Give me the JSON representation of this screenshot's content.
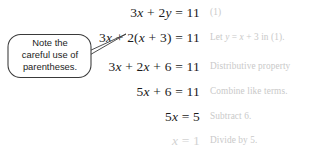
{
  "page": {
    "background_color": "#ffffff",
    "equation_color": "#1b1b1b",
    "faded_color": "#d2d2d2",
    "reason_color": "#c9c9c9",
    "callout_border_color": "#3a3a3a",
    "callout_text_color": "#232323"
  },
  "callout": {
    "line1": "Note the",
    "line2": "careful use of",
    "line3": "parentheses."
  },
  "steps": [
    {
      "equation_plain": "3x + 2y = 11",
      "reason": "(1)",
      "faded": false
    },
    {
      "equation_plain": "3x + 2(x + 3) = 11",
      "reason": "Let y = x + 3 in (1).",
      "faded": false
    },
    {
      "equation_plain": "3x + 2x + 6 = 11",
      "reason": "Distributive property",
      "faded": false
    },
    {
      "equation_plain": "5x + 6 = 11",
      "reason": "Combine like terms.",
      "faded": false
    },
    {
      "equation_plain": "5x = 5",
      "reason": "Subtract 6.",
      "faded": false
    },
    {
      "equation_plain": "x = 1",
      "reason": "Divide by 5.",
      "faded": true
    }
  ],
  "equation_parts": {
    "s0": [
      {
        "t": "3",
        "i": false
      },
      {
        "t": "x",
        "i": true
      },
      {
        "t": " + 2",
        "i": false
      },
      {
        "t": "y",
        "i": true
      },
      {
        "t": " = 11",
        "i": false
      }
    ],
    "s1": [
      {
        "t": "3",
        "i": false
      },
      {
        "t": "x",
        "i": true
      },
      {
        "t": " + 2(",
        "i": false
      },
      {
        "t": "x",
        "i": true
      },
      {
        "t": " + 3) = 11",
        "i": false
      }
    ],
    "s2": [
      {
        "t": "3",
        "i": false
      },
      {
        "t": "x",
        "i": true
      },
      {
        "t": " + 2",
        "i": false
      },
      {
        "t": "x",
        "i": true
      },
      {
        "t": " + 6 = 11",
        "i": false
      }
    ],
    "s3": [
      {
        "t": "5",
        "i": false
      },
      {
        "t": "x",
        "i": true
      },
      {
        "t": " + 6 = 11",
        "i": false
      }
    ],
    "s4": [
      {
        "t": "5",
        "i": false
      },
      {
        "t": "x",
        "i": true
      },
      {
        "t": " = 5",
        "i": false
      }
    ],
    "s5": [
      {
        "t": "x",
        "i": true
      },
      {
        "t": " = 1",
        "i": false
      }
    ]
  },
  "reason_parts": {
    "r0": [
      {
        "t": "(1)",
        "i": false
      }
    ],
    "r1": [
      {
        "t": "Let ",
        "i": false
      },
      {
        "t": "y",
        "i": true
      },
      {
        "t": " = ",
        "i": false
      },
      {
        "t": "x",
        "i": true
      },
      {
        "t": " + 3 in (1).",
        "i": false
      }
    ],
    "r2": [
      {
        "t": "Distributive property",
        "i": false
      }
    ],
    "r3": [
      {
        "t": "Combine like terms.",
        "i": false
      }
    ],
    "r4": [
      {
        "t": "Subtract 6.",
        "i": false
      }
    ],
    "r5": [
      {
        "t": "Divide by 5.",
        "i": false
      }
    ]
  },
  "layout": {
    "row_tops": [
      0,
      25,
      54,
      79,
      104,
      128
    ]
  }
}
